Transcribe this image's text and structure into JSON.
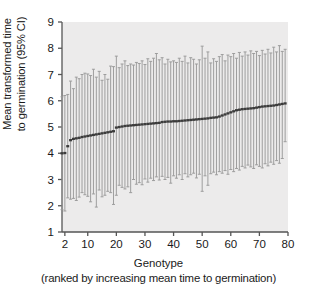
{
  "chart_data": {
    "type": "scatter",
    "title": "",
    "xlabel": "Genotype",
    "xlabel_sub": "(ranked by increasing mean time to germination)",
    "ylabel": "Mean transformed time\nto germination (95% CI)",
    "xlim": [
      1,
      80
    ],
    "ylim": [
      1,
      9
    ],
    "xticks": [
      2,
      10,
      20,
      30,
      40,
      50,
      60,
      70,
      80
    ],
    "yticks": [
      1,
      2,
      3,
      4,
      5,
      6,
      7,
      8,
      9
    ],
    "grid": false,
    "legend": null,
    "plot_bg_color": "#ecebeb",
    "errorbar_color": "#9a9a9a",
    "marker_color": "#3b3b3b",
    "axis_color": "#555555",
    "series_note": "Each genotype has a mean marker and a 95% confidence interval shown as a vertical error bar with caps.",
    "x": [
      1,
      2,
      3,
      4,
      5,
      6,
      7,
      8,
      9,
      10,
      11,
      12,
      13,
      14,
      15,
      16,
      17,
      18,
      19,
      20,
      21,
      22,
      23,
      24,
      25,
      26,
      27,
      28,
      29,
      30,
      31,
      32,
      33,
      34,
      35,
      36,
      37,
      38,
      39,
      40,
      41,
      42,
      43,
      44,
      45,
      46,
      47,
      48,
      49,
      50,
      51,
      52,
      53,
      54,
      55,
      56,
      57,
      58,
      59,
      60,
      61,
      62,
      63,
      64,
      65,
      66,
      67,
      68,
      69,
      70,
      71,
      72,
      73,
      74,
      75,
      76,
      77,
      78,
      79
    ],
    "mean": [
      4.0,
      4.01,
      4.27,
      4.5,
      4.55,
      4.57,
      4.59,
      4.62,
      4.64,
      4.66,
      4.68,
      4.7,
      4.72,
      4.74,
      4.76,
      4.78,
      4.8,
      4.82,
      4.84,
      4.98,
      5.0,
      5.02,
      5.04,
      5.05,
      5.06,
      5.07,
      5.08,
      5.09,
      5.1,
      5.11,
      5.12,
      5.13,
      5.14,
      5.15,
      5.16,
      5.19,
      5.2,
      5.21,
      5.21,
      5.22,
      5.22,
      5.23,
      5.24,
      5.25,
      5.26,
      5.27,
      5.28,
      5.29,
      5.3,
      5.31,
      5.32,
      5.33,
      5.35,
      5.36,
      5.37,
      5.4,
      5.44,
      5.48,
      5.52,
      5.56,
      5.6,
      5.64,
      5.66,
      5.68,
      5.69,
      5.7,
      5.71,
      5.72,
      5.74,
      5.76,
      5.78,
      5.79,
      5.8,
      5.81,
      5.82,
      5.84,
      5.86,
      5.88,
      5.9
    ],
    "ci_low": [
      1.85,
      1.8,
      2.3,
      2.25,
      2.28,
      2.2,
      2.33,
      2.5,
      2.42,
      2.36,
      2.15,
      2.45,
      1.95,
      2.6,
      2.34,
      2.4,
      2.55,
      2.5,
      2.05,
      2.4,
      2.78,
      2.7,
      2.64,
      2.72,
      2.5,
      3.0,
      2.82,
      2.88,
      2.8,
      3.02,
      2.9,
      3.05,
      2.96,
      3.1,
      2.98,
      3.12,
      3.0,
      3.08,
      2.86,
      3.14,
      3.05,
      3.18,
      3.0,
      3.22,
      3.1,
      3.18,
      3.24,
      3.06,
      3.2,
      2.55,
      3.14,
      2.78,
      3.22,
      3.28,
      3.18,
      3.3,
      3.24,
      3.34,
      3.2,
      3.38,
      3.3,
      3.42,
      3.36,
      3.5,
      3.44,
      3.55,
      3.48,
      3.42,
      3.56,
      3.5,
      3.44,
      3.6,
      3.52,
      3.66,
      3.58,
      3.72,
      3.62,
      3.8,
      4.44
    ],
    "ci_high": [
      6.15,
      6.2,
      6.24,
      6.75,
      6.46,
      6.9,
      6.84,
      7.0,
      7.05,
      7.02,
      6.96,
      7.2,
      6.9,
      7.12,
      6.78,
      7.0,
      6.82,
      7.32,
      7.3,
      7.7,
      7.26,
      7.4,
      7.52,
      7.34,
      7.4,
      7.36,
      7.46,
      7.42,
      7.52,
      7.38,
      7.6,
      7.5,
      7.62,
      7.8,
      7.56,
      7.64,
      7.4,
      7.58,
      7.48,
      7.52,
      7.46,
      7.62,
      7.5,
      7.7,
      7.44,
      7.64,
      7.58,
      7.4,
      7.56,
      8.08,
      7.62,
      7.86,
      7.44,
      7.6,
      7.5,
      7.68,
      7.76,
      7.52,
      7.74,
      7.68,
      7.8,
      7.62,
      7.84,
      7.7,
      7.86,
      7.74,
      7.9,
      7.8,
      7.88,
      7.72,
      7.92,
      7.78,
      7.96,
      7.82,
      8.04,
      7.86,
      8.1,
      7.88,
      7.96
    ]
  }
}
